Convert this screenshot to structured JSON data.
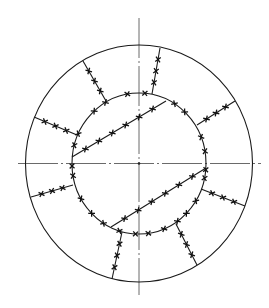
{
  "diagram": {
    "title": "",
    "colors": {
      "line": "#1a1a1a",
      "centerline": "#444444",
      "background": "#ffffff"
    },
    "center": {
      "x": 139,
      "y": 163.5
    },
    "outer_circle": {
      "rx": 113.5,
      "ry": 118.5
    },
    "inner_circle": {
      "rx": 67,
      "ry": 70.5
    },
    "centerlines": {
      "horizontal": {
        "x1": 18,
        "y1": 163.5,
        "x2": 261,
        "y2": 163.5
      },
      "vertical": {
        "x1": 139,
        "y1": 18,
        "x2": 139,
        "y2": 295
      }
    },
    "chords": [
      {
        "name": "upper-chord",
        "x1": 72,
        "y1": 157,
        "x2": 166,
        "y2": 101
      },
      {
        "name": "lower-chord",
        "x1": 111,
        "y1": 227,
        "x2": 206,
        "y2": 168
      }
    ],
    "ribs": [
      {
        "name": "rib-top-left",
        "x1": 106,
        "y1": 101,
        "x2": 83,
        "y2": 61
      },
      {
        "name": "rib-top-right",
        "x1": 152,
        "y1": 94,
        "x2": 160,
        "y2": 48
      },
      {
        "name": "rib-right-upper",
        "x1": 197,
        "y1": 125,
        "x2": 235,
        "y2": 101
      },
      {
        "name": "rib-left-upper",
        "x1": 77,
        "y1": 135,
        "x2": 34,
        "y2": 117
      },
      {
        "name": "rib-left-lower",
        "x1": 73,
        "y1": 185,
        "x2": 31,
        "y2": 197
      },
      {
        "name": "rib-right-lower",
        "x1": 201,
        "y1": 189,
        "x2": 245,
        "y2": 206
      },
      {
        "name": "rib-bottom-left",
        "x1": 122,
        "y1": 232,
        "x2": 112,
        "y2": 279
      },
      {
        "name": "rib-bottom-right",
        "x1": 176,
        "y1": 224,
        "x2": 197,
        "y2": 265
      }
    ],
    "weld_marks_per_line": 3,
    "weld_marks_on_chords": 6,
    "inner_circle_weld_angles_deg": [
      -100,
      -85,
      -58,
      -47,
      -22,
      -10,
      5,
      12,
      32,
      45,
      55,
      68,
      82,
      93,
      107,
      122,
      135,
      150,
      170,
      178,
      195,
      205,
      228,
      240
    ]
  }
}
